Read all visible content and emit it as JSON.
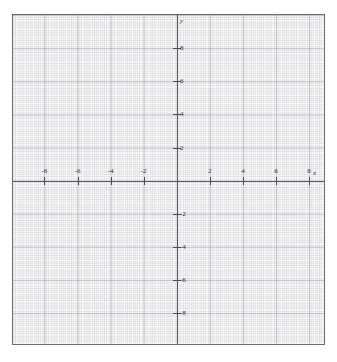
{
  "figure": {
    "name": "cartesian-coordinate-grid",
    "background_color": "#ffffff",
    "frame_color": "#6c6c70",
    "axis_color": "#55555b",
    "grid_color": "#8c8c98",
    "label_color": "#2e2e33"
  },
  "axes": {
    "x_label": "x",
    "y_label": "y"
  },
  "chart_data": {
    "type": "scatter",
    "title": "",
    "subtitle": "",
    "xlabel": "x",
    "ylabel": "y",
    "xlim": [
      -9.9,
      9.0
    ],
    "ylim": [
      -10.0,
      10.0
    ],
    "grid": true,
    "minor_grid": true,
    "major_grid_step": 2,
    "minor_grid_step": 0.5,
    "legend": null,
    "series": [],
    "x": [],
    "values": [],
    "annotations": [],
    "x_tick_labels": [
      "-8",
      "-6",
      "-4",
      "-2",
      "2",
      "4",
      "6",
      "8"
    ],
    "x_tick_values": [
      -8,
      -6,
      -4,
      -2,
      2,
      4,
      6,
      8
    ],
    "y_tick_labels": [
      "8",
      "6",
      "4",
      "2",
      "-2",
      "-4",
      "-6",
      "-8"
    ],
    "y_tick_values": [
      8,
      6,
      4,
      2,
      -2,
      -4,
      -6,
      -8
    ]
  },
  "x_ticks": [
    {
      "label": "-8",
      "value": -8,
      "px": 31.4
    },
    {
      "label": "-6",
      "value": -6,
      "px": 64.5
    },
    {
      "label": "-4",
      "value": -4,
      "px": 97.5
    },
    {
      "label": "-2",
      "value": -2,
      "px": 130.6
    },
    {
      "label": "2",
      "value": 2,
      "px": 196.8
    },
    {
      "label": "4",
      "value": 4,
      "px": 229.9
    },
    {
      "label": "6",
      "value": 6,
      "px": 262.9
    },
    {
      "label": "8",
      "value": 8,
      "px": 296.0
    }
  ],
  "y_ticks": [
    {
      "label": "8",
      "value": 8,
      "px": 33.2
    },
    {
      "label": "6",
      "value": 6,
      "px": 66.3
    },
    {
      "label": "4",
      "value": 4,
      "px": 99.4
    },
    {
      "label": "2",
      "value": 2,
      "px": 132.5
    },
    {
      "label": "-2",
      "value": -2,
      "px": 198.7
    },
    {
      "label": "-4",
      "value": -4,
      "px": 231.8
    },
    {
      "label": "-6",
      "value": -6,
      "px": 264.9
    },
    {
      "label": "-8",
      "value": -8,
      "px": 298.0
    }
  ]
}
